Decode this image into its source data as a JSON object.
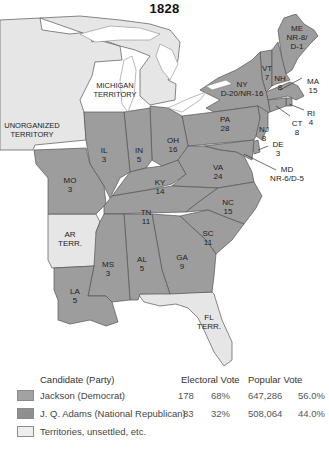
{
  "title": "1828",
  "colors": {
    "jackson": "#9d9d9d",
    "adams": "#8f8f8f",
    "territory": "#e6e6e6",
    "water": "#ffffff",
    "border": "#555555"
  },
  "map": {
    "regions": [
      {
        "name": "unorganized-territory",
        "label1": "UNORGANIZED",
        "label2": "TERRITORY",
        "type": "territory"
      },
      {
        "name": "michigan-territory",
        "label1": "MICHIGAN",
        "label2": "TERRITORY",
        "type": "territory"
      },
      {
        "name": "arkansas-territory",
        "label1": "AR",
        "label2": "TERR.",
        "type": "territory"
      },
      {
        "name": "florida-territory",
        "label1": "FL",
        "label2": "TERR.",
        "type": "territory"
      }
    ],
    "states": [
      {
        "abbr": "ME",
        "votes": "NR-8/",
        "votes2": "D-1",
        "party": "split"
      },
      {
        "abbr": "VT",
        "votes": "7",
        "party": "adams"
      },
      {
        "abbr": "NH",
        "votes": "8",
        "party": "adams"
      },
      {
        "abbr": "MA",
        "votes": "15",
        "party": "adams"
      },
      {
        "abbr": "RI",
        "votes": "4",
        "party": "adams"
      },
      {
        "abbr": "CT",
        "votes": "8",
        "party": "adams"
      },
      {
        "abbr": "NY",
        "votes": "D-20/NR-16",
        "party": "split"
      },
      {
        "abbr": "NJ",
        "votes": "8",
        "party": "adams"
      },
      {
        "abbr": "DE",
        "votes": "3",
        "party": "adams"
      },
      {
        "abbr": "MD",
        "votes": "NR-6/D-5",
        "party": "split"
      },
      {
        "abbr": "PA",
        "votes": "28",
        "party": "jackson"
      },
      {
        "abbr": "OH",
        "votes": "16",
        "party": "jackson"
      },
      {
        "abbr": "IN",
        "votes": "5",
        "party": "jackson"
      },
      {
        "abbr": "IL",
        "votes": "3",
        "party": "jackson"
      },
      {
        "abbr": "MO",
        "votes": "3",
        "party": "jackson"
      },
      {
        "abbr": "KY",
        "votes": "14",
        "party": "jackson"
      },
      {
        "abbr": "VA",
        "votes": "24",
        "party": "jackson"
      },
      {
        "abbr": "TN",
        "votes": "11",
        "party": "jackson"
      },
      {
        "abbr": "NC",
        "votes": "15",
        "party": "jackson"
      },
      {
        "abbr": "SC",
        "votes": "11",
        "party": "jackson"
      },
      {
        "abbr": "GA",
        "votes": "9",
        "party": "jackson"
      },
      {
        "abbr": "AL",
        "votes": "5",
        "party": "jackson"
      },
      {
        "abbr": "MS",
        "votes": "3",
        "party": "jackson"
      },
      {
        "abbr": "LA",
        "votes": "5",
        "party": "jackson"
      }
    ]
  },
  "legend": {
    "headers": {
      "candidate": "Candidate (Party)",
      "electoral": "Electoral Vote",
      "popular": "Popular Vote"
    },
    "rows": [
      {
        "label": "Jackson (Democrat)",
        "ev": "178",
        "ev_pct": "68%",
        "pv": "647,286",
        "pv_pct": "56.0%"
      },
      {
        "label": "J. Q. Adams (National Republican)",
        "ev": "83",
        "ev_pct": "32%",
        "pv": "508,064",
        "pv_pct": "44.0%"
      },
      {
        "label": "Territories, unsettled, etc."
      }
    ]
  }
}
